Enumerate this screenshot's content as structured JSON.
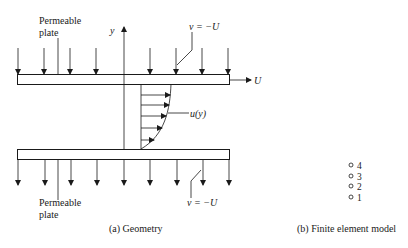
{
  "geometry": {
    "top_plate_label_line1": "Permeable",
    "top_plate_label_line2": "plate",
    "bottom_plate_label_line1": "Permeable",
    "bottom_plate_label_line2": "plate",
    "y_axis_label": "y",
    "top_suction_label": "v = −U",
    "bottom_suction_label": "v = −U",
    "plate_velocity_label": "U",
    "profile_label": "u(y)",
    "caption": "(a) Geometry"
  },
  "fe_model": {
    "nodes": [
      {
        "label": "4"
      },
      {
        "label": "3"
      },
      {
        "label": "2"
      },
      {
        "label": "1"
      }
    ],
    "caption": "(b) Finite element model"
  },
  "colors": {
    "ink": "#1a1a1a",
    "background": "#ffffff"
  }
}
